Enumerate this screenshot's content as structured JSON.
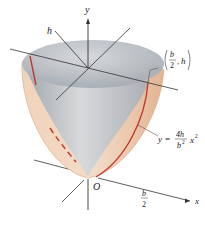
{
  "figure": {
    "type": "paraboloid-volume-diagram",
    "axes": {
      "y_label": "y",
      "x_label": "x",
      "origin_label": "O"
    },
    "labels": {
      "height": "h",
      "point_num": "b",
      "point_den": "2",
      "point_sep": ",",
      "point_h": "h",
      "curve_y": "y",
      "curve_eq": "=",
      "curve_num": "4h",
      "curve_den": "b",
      "curve_den_exp": "2",
      "curve_x": "x",
      "curve_x_exp": "2",
      "b_num": "b",
      "b_den": "2"
    },
    "colors": {
      "surface_outer": "#e9c2a3",
      "surface_inner": "#b9bec4",
      "top_disk": "#c7ccd2",
      "parabola": "#c0392b",
      "axis": "#333333"
    }
  }
}
